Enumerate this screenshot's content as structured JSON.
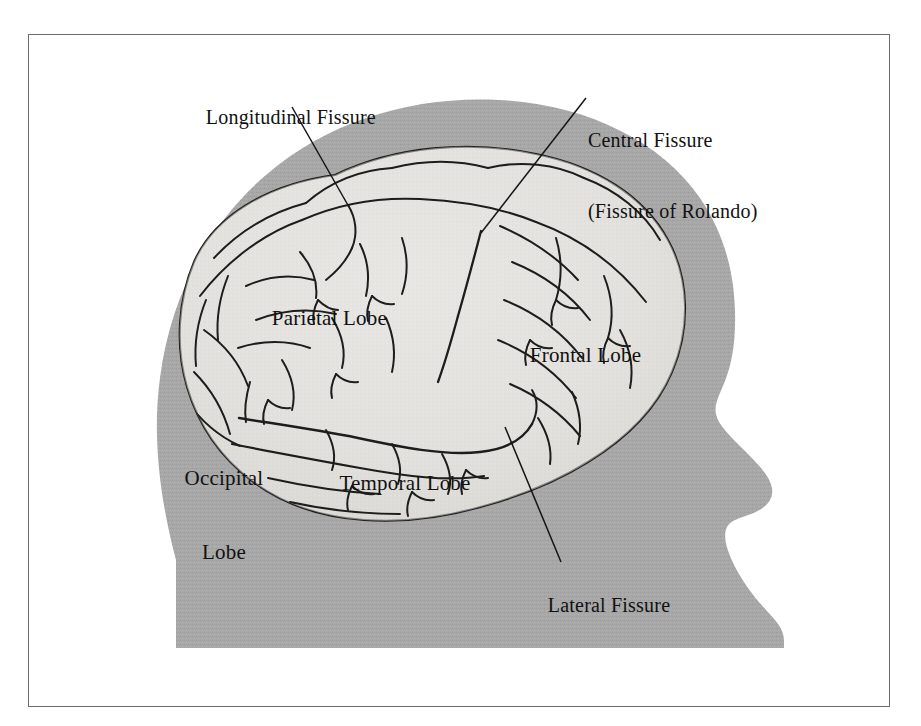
{
  "figure": {
    "kind": "anatomical-illustration",
    "background_color": "#ffffff",
    "frame_color": "#6d6d6d",
    "head_silhouette_color": "#a8a8a8",
    "brain_surface_color": "#e4e2de",
    "ink_color": "#1a1a1a"
  },
  "labels": {
    "longitudinal_fissure": "Longitudinal Fissure",
    "central_fissure_line1": "Central Fissure",
    "central_fissure_line2": "(Fissure of Rolando)",
    "parietal_lobe": "Parietal Lobe",
    "frontal_lobe": "Frontal Lobe",
    "occipital_lobe_line1": "Occipital",
    "occipital_lobe_line2": "Lobe",
    "temporal_lobe": "Temporal Lobe",
    "lateral_fissure": "Lateral Fissure"
  },
  "structures": [
    {
      "name": "Longitudinal Fissure",
      "type": "fissure",
      "has_leader_line": true
    },
    {
      "name": "Central Fissure (Fissure of Rolando)",
      "type": "fissure",
      "has_leader_line": true
    },
    {
      "name": "Lateral Fissure",
      "type": "fissure",
      "has_leader_line": true
    },
    {
      "name": "Frontal Lobe",
      "type": "lobe",
      "has_leader_line": false
    },
    {
      "name": "Parietal Lobe",
      "type": "lobe",
      "has_leader_line": false
    },
    {
      "name": "Temporal Lobe",
      "type": "lobe",
      "has_leader_line": false
    },
    {
      "name": "Occipital Lobe",
      "type": "lobe",
      "has_leader_line": false
    }
  ]
}
